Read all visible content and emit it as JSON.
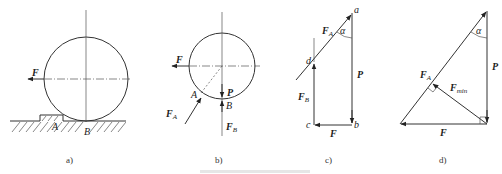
{
  "figure": {
    "panels": [
      {
        "id": "a",
        "caption": "a)",
        "labels": {
          "force": "F",
          "point_a": "A",
          "point_b": "B"
        }
      },
      {
        "id": "b",
        "caption": "b)",
        "labels": {
          "force": "F",
          "point_a": "A",
          "point_b": "B",
          "weight": "P",
          "force_a": "F",
          "force_a_sub": "A",
          "force_b": "F",
          "force_b_sub": "B"
        }
      },
      {
        "id": "c",
        "caption": "c)",
        "labels": {
          "vertex_a": "a",
          "vertex_b": "b",
          "vertex_c": "c",
          "vertex_d": "d",
          "force_a": "F",
          "force_a_sub": "A",
          "angle": "α",
          "weight": "P",
          "force_b": "F",
          "force_b_sub": "B",
          "force": "F"
        }
      },
      {
        "id": "d",
        "caption": "d)",
        "labels": {
          "angle": "α",
          "weight": "P",
          "force_a": "F",
          "force_a_sub": "A",
          "force_min": "F",
          "force_min_sub": "min",
          "force": "F"
        }
      }
    ],
    "colors": {
      "line": "#333333",
      "background": "#ffffff"
    }
  }
}
